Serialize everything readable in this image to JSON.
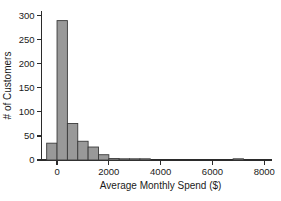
{
  "chart_data": {
    "type": "bar",
    "title": "",
    "subtitle": "",
    "xlabel": "Average Monthly Spend ($)",
    "ylabel": "# of Customers",
    "grid": false,
    "legend": "none",
    "xlim": [
      -600,
      8300
    ],
    "ylim": [
      0,
      310
    ],
    "bin_width": 400,
    "x_ticks": [
      0,
      2000,
      4000,
      6000,
      8000
    ],
    "x_tick_labels": [
      "0",
      "2000",
      "4000",
      "6000",
      "8000"
    ],
    "y_ticks": [
      0,
      50,
      100,
      150,
      200,
      250,
      300
    ],
    "y_tick_labels": [
      "0",
      "50",
      "100",
      "150",
      "200",
      "250",
      "300"
    ],
    "bins": [
      {
        "start": -400,
        "end": 0,
        "value": 35
      },
      {
        "start": 0,
        "end": 400,
        "value": 290
      },
      {
        "start": 400,
        "end": 800,
        "value": 76
      },
      {
        "start": 800,
        "end": 1200,
        "value": 39
      },
      {
        "start": 1200,
        "end": 1600,
        "value": 27
      },
      {
        "start": 1600,
        "end": 2000,
        "value": 11
      },
      {
        "start": 2000,
        "end": 2400,
        "value": 3
      },
      {
        "start": 2400,
        "end": 2800,
        "value": 2
      },
      {
        "start": 2800,
        "end": 3200,
        "value": 2
      },
      {
        "start": 3200,
        "end": 3600,
        "value": 1
      },
      {
        "start": 6800,
        "end": 7200,
        "value": 2
      }
    ],
    "categories": [
      "-400",
      "0",
      "400",
      "800",
      "1200",
      "1600",
      "2000",
      "2400",
      "2800",
      "3200",
      "6800"
    ],
    "values": [
      35,
      290,
      76,
      39,
      27,
      11,
      3,
      2,
      2,
      1,
      2
    ],
    "colors": {
      "bar_fill": "#999999",
      "bar_stroke": "#3a3a3a",
      "axis": "#2b2b2b",
      "text": "#1a1a1a",
      "background": "#ffffff"
    }
  }
}
